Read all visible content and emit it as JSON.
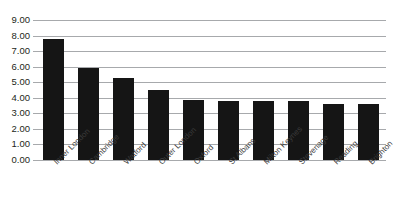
{
  "chart_data": {
    "type": "bar",
    "title": "",
    "xlabel": "",
    "ylabel": "",
    "categories": [
      "Inner London",
      "Cambridge",
      "Watford",
      "Outer London",
      "Oxford",
      "St Albans",
      "Milton Keynes",
      "Stevenage",
      "Reading",
      "Brighton"
    ],
    "values": [
      7.8,
      5.9,
      5.3,
      4.5,
      3.85,
      3.78,
      3.77,
      3.77,
      3.62,
      3.6
    ],
    "ylim": [
      0,
      9
    ],
    "ytick_step": 1,
    "ytick_labels": [
      "0.00",
      "1.00",
      "2.00",
      "3.00",
      "4.00",
      "5.00",
      "6.00",
      "7.00",
      "8.00",
      "9.00"
    ],
    "grid": true,
    "legend": false,
    "bar_color": "#151515",
    "grid_color": "#a7a9ac",
    "background_color": "#ffffff",
    "label_color": "#231f20",
    "category_label_rotation": -45,
    "value_labels_shown": false,
    "title_cropped": true,
    "title_sliver_text": ""
  }
}
